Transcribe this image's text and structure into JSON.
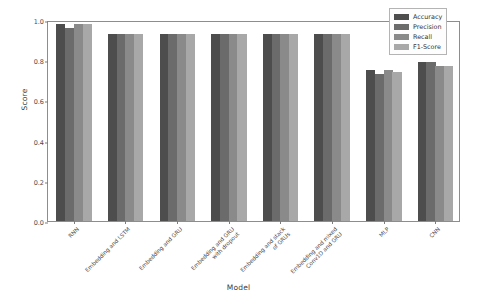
{
  "chart_data": {
    "type": "bar",
    "title": "",
    "xlabel": "Model",
    "ylabel": "Score",
    "ylim": [
      0.0,
      1.0
    ],
    "yticks": [
      "0.0",
      "0.2",
      "0.4",
      "0.6",
      "0.8",
      "1.0"
    ],
    "ytick_values": [
      0.0,
      0.2,
      0.4,
      0.6,
      0.8,
      1.0
    ],
    "grid": false,
    "legend_position": "upper right",
    "categories": [
      "RNN",
      "Embedding and LSTM",
      "Embedding and GRU",
      "Embedding and GRU\nwith dropout",
      "Embedding and stack\nof GRUs",
      "Embedding and mixed\nConv1D and GRU",
      "MLP",
      "CNN"
    ],
    "series": [
      {
        "name": "Accuracy",
        "color": "#4d4d4d",
        "values": [
          0.98,
          0.93,
          0.93,
          0.93,
          0.93,
          0.93,
          0.75,
          0.79
        ]
      },
      {
        "name": "Precision",
        "color": "#6b6b6b",
        "values": [
          0.96,
          0.93,
          0.93,
          0.93,
          0.93,
          0.93,
          0.73,
          0.79
        ]
      },
      {
        "name": "Recall",
        "color": "#8a8a8a",
        "values": [
          0.98,
          0.93,
          0.93,
          0.93,
          0.93,
          0.93,
          0.75,
          0.77
        ]
      },
      {
        "name": "F1-Score",
        "color": "#a8a8a8",
        "values": [
          0.98,
          0.93,
          0.93,
          0.93,
          0.93,
          0.93,
          0.74,
          0.77
        ]
      }
    ]
  },
  "axes": {
    "frame_color": "#8d8d8d",
    "tick_color": "#7d7d7d"
  }
}
